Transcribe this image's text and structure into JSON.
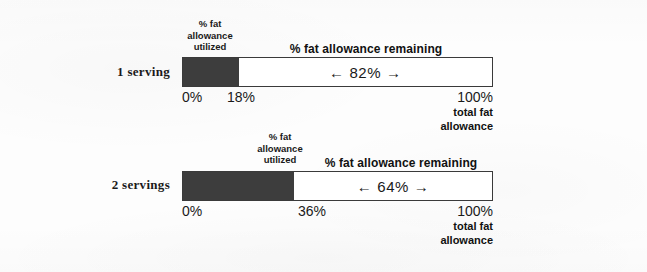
{
  "chart_data": {
    "type": "bar",
    "title": "",
    "subtitle": "",
    "orientation": "horizontal",
    "stacked": true,
    "xlabel": "",
    "ylabel": "",
    "xlim": [
      0,
      100
    ],
    "grid": false,
    "legend": "inline-annotations",
    "categories": [
      "1 serving",
      "2 servings"
    ],
    "series": [
      {
        "name": "% fat allowance utilized",
        "values": [
          18,
          36
        ],
        "color": "#3d3d3d"
      },
      {
        "name": "% fat allowance remaining",
        "values": [
          82,
          64
        ],
        "color": "#ffffff"
      }
    ],
    "tick_labels": {
      "start": "0%",
      "end": "100%",
      "midpoints": [
        "18%",
        "36%"
      ]
    },
    "annotations": [
      "← 82% →",
      "← 64% →",
      "total fat allowance"
    ]
  },
  "charts": [
    {
      "row_label": "1 serving",
      "utilized_caption_lines": [
        "% fat",
        "allowance",
        "utilized"
      ],
      "remaining_caption": "% fat allowance remaining",
      "remaining_value_text": "← 82% →",
      "utilized_percent": 18,
      "remaining_percent": 82,
      "tick_start": "0%",
      "tick_mid": "18%",
      "tick_end": "100%",
      "total_note_line1": "total fat",
      "total_note_line2": "allowance"
    },
    {
      "row_label": "2 servings",
      "utilized_caption_lines": [
        "% fat",
        "allowance",
        "utilized"
      ],
      "remaining_caption": "% fat allowance remaining",
      "remaining_value_text": "← 64% →",
      "utilized_percent": 36,
      "remaining_percent": 64,
      "tick_start": "0%",
      "tick_mid": "36%",
      "tick_end": "100%",
      "total_note_line1": "total fat",
      "total_note_line2": "allowance"
    }
  ],
  "colors": {
    "utilized_fill": "#3d3d3d",
    "remaining_fill": "#ffffff",
    "bar_border": "#3a3a3a",
    "text": "#1a1a1a",
    "page_background": "#fdfdfd"
  }
}
